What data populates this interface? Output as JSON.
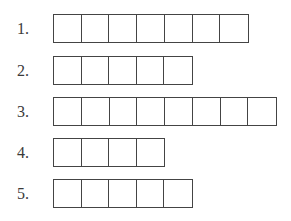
{
  "rows": [
    {
      "label": "1.",
      "cells": 7,
      "top": 14
    },
    {
      "label": "2.",
      "cells": 5,
      "top": 56
    },
    {
      "label": "3.",
      "cells": 8,
      "top": 97
    },
    {
      "label": "4.",
      "cells": 4,
      "top": 138
    },
    {
      "label": "5.",
      "cells": 5,
      "top": 179
    }
  ]
}
